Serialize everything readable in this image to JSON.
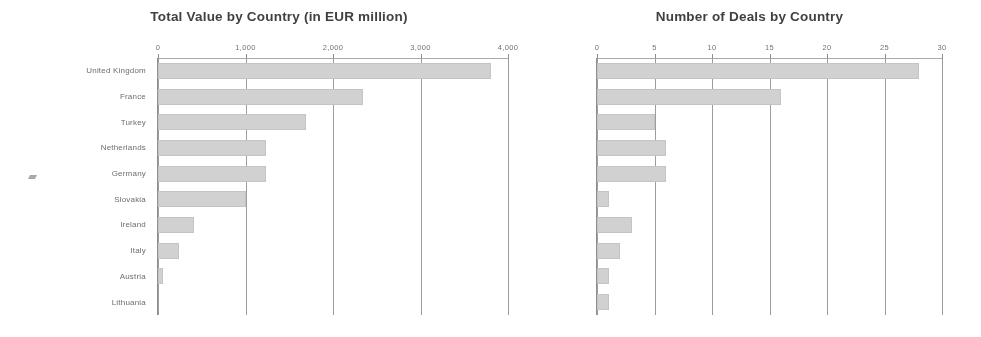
{
  "chart_data": [
    {
      "type": "bar",
      "orientation": "horizontal",
      "title": "Total Value by Country (in EUR million)",
      "xlabel": "",
      "ylabel": "",
      "categories": [
        "United Kingdom",
        "France",
        "Turkey",
        "Netherlands",
        "Germany",
        "Slovakia",
        "Ireland",
        "Italy",
        "Austria",
        "Lithuania"
      ],
      "values": [
        3800,
        2340,
        1690,
        1230,
        1230,
        1000,
        410,
        240,
        60,
        0
      ],
      "xlim": [
        0,
        4000
      ],
      "ticks": [
        0,
        1000,
        2000,
        3000,
        4000
      ],
      "tick_labels": [
        "0",
        "1,000",
        "2,000",
        "3,000",
        "4,000"
      ],
      "grid": true,
      "legend": "none",
      "bar_color": "#d2d2d2"
    },
    {
      "type": "bar",
      "orientation": "horizontal",
      "title": "Number of Deals by Country",
      "xlabel": "",
      "ylabel": "",
      "categories": [
        "United Kingdom",
        "France",
        "Turkey",
        "Netherlands",
        "Germany",
        "Slovakia",
        "Ireland",
        "Italy",
        "Austria",
        "Lithuania"
      ],
      "values": [
        28,
        16,
        5,
        6,
        6,
        1,
        3,
        2,
        1,
        1
      ],
      "xlim": [
        0,
        30
      ],
      "ticks": [
        0,
        5,
        10,
        15,
        20,
        25,
        30
      ],
      "tick_labels": [
        "0",
        "5",
        "10",
        "15",
        "20",
        "25",
        "30"
      ],
      "grid": true,
      "legend": "none",
      "bar_color": "#d2d2d2"
    }
  ]
}
